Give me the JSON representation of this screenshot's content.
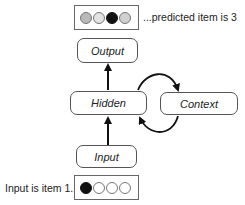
{
  "diagram": {
    "type": "simple recurrent network (Elman network)",
    "output_vector": {
      "label": "...predicted item is 3",
      "units": [
        {
          "index": 1,
          "fill": "#b9b9b9",
          "state": "partial"
        },
        {
          "index": 2,
          "fill": "#e2e2e2",
          "state": "weak"
        },
        {
          "index": 3,
          "fill": "#111111",
          "state": "active"
        },
        {
          "index": 4,
          "fill": "#d0d0d0",
          "state": "weak"
        }
      ]
    },
    "input_vector": {
      "label": "Input is item 1...",
      "units": [
        {
          "index": 1,
          "fill": "#111111",
          "state": "active"
        },
        {
          "index": 2,
          "fill": "#ffffff",
          "state": "off"
        },
        {
          "index": 3,
          "fill": "#ffffff",
          "state": "off"
        },
        {
          "index": 4,
          "fill": "#ffffff",
          "state": "off"
        }
      ]
    },
    "nodes": {
      "output": "Output",
      "hidden": "Hidden",
      "context": "Context",
      "input": "Input"
    },
    "edges": [
      {
        "from": "Input",
        "to": "Hidden",
        "style": "straight arrow"
      },
      {
        "from": "Hidden",
        "to": "Output",
        "style": "straight arrow"
      },
      {
        "from": "Hidden",
        "to": "Context",
        "style": "curved arrow (top)"
      },
      {
        "from": "Context",
        "to": "Hidden",
        "style": "curved arrow (bottom)"
      }
    ],
    "colors": {
      "line": "#111111",
      "box_border": "#555555"
    }
  }
}
